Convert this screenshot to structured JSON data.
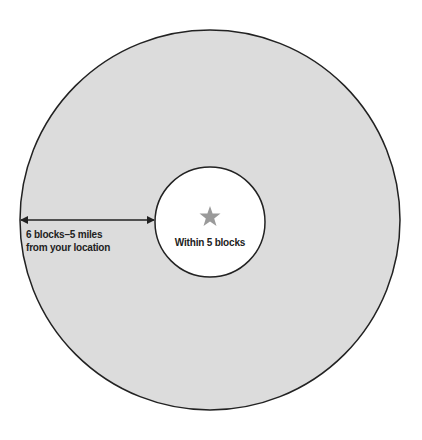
{
  "diagram": {
    "outer_zone": {
      "label_line1": "6 blocks–5 miles",
      "label_line2": "from your location",
      "fill": "#dcdcdc",
      "stroke": "#222222"
    },
    "inner_zone": {
      "label": "Within 5 blocks",
      "fill": "#ffffff",
      "stroke": "#222222"
    },
    "center_marker": {
      "icon": "star-icon",
      "color": "#9a9a9a"
    }
  }
}
